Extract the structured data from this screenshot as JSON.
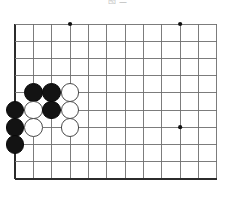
{
  "figure": {
    "kind": "go-board-diagram",
    "caption_top": "图 二",
    "background_color": "#ffffff"
  },
  "board": {
    "label": "go-board",
    "origin_x": 15,
    "origin_y": 24,
    "col_spacing": 18.35,
    "row_spacing": 17.2,
    "cols": 12,
    "rows": 10,
    "line_color": "#6e6e6e",
    "edge_color": "#2b2b2b",
    "edge_width": 1.9,
    "line_width": 0.9,
    "stone_radius": 9.4,
    "star_points": [
      {
        "name": "star-point-top-left",
        "col": 3,
        "row": 0
      },
      {
        "name": "star-point-top-right",
        "col": 9,
        "row": 0
      },
      {
        "name": "star-point-mid-right",
        "col": 9,
        "row": 6
      }
    ],
    "star_color": "#111111",
    "star_radius": 2.1
  },
  "stones": [
    {
      "name": "stone-black-c1r4",
      "color": "black",
      "col": 1,
      "row": 4
    },
    {
      "name": "stone-black-c2r4",
      "color": "black",
      "col": 2,
      "row": 4
    },
    {
      "name": "stone-white-c3r4",
      "color": "white",
      "col": 3,
      "row": 4
    },
    {
      "name": "stone-black-c0r5",
      "color": "black",
      "col": 0,
      "row": 5
    },
    {
      "name": "stone-white-c1r5",
      "color": "white",
      "col": 1,
      "row": 5
    },
    {
      "name": "stone-black-c2r5",
      "color": "black",
      "col": 2,
      "row": 5
    },
    {
      "name": "stone-white-c3r5",
      "color": "white",
      "col": 3,
      "row": 5
    },
    {
      "name": "stone-black-c0r6",
      "color": "black",
      "col": 0,
      "row": 6
    },
    {
      "name": "stone-white-c1r6",
      "color": "white",
      "col": 1,
      "row": 6
    },
    {
      "name": "stone-white-c3r6",
      "color": "white",
      "col": 3,
      "row": 6
    },
    {
      "name": "stone-black-c0r7",
      "color": "black",
      "col": 0,
      "row": 7
    }
  ],
  "colors": {
    "black_stone": "#131313",
    "white_stone": "#ffffff",
    "white_stone_border": "#4a4a4a",
    "grid_line": "#6e6e6e",
    "board_edge": "#2b2b2b"
  }
}
